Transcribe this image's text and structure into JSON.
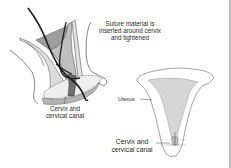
{
  "diagram": {
    "labels": {
      "suture": [
        "Suture material is",
        "inserted around cervix",
        "and tightened"
      ],
      "cervix_left": [
        "Cervix and",
        "cervical canal"
      ],
      "uterus": "Uterus",
      "cervix_right": [
        "Cervix and",
        "cervical canal"
      ]
    },
    "colors": {
      "outline": "#555555",
      "light_fill": "#d9d9d9",
      "mid_fill": "#a9a9a9",
      "dark_fill": "#7a7a7a",
      "suture": "#1e1e1e",
      "uterus_cavity": "#d6d6d6",
      "frame": "#bdbdbd"
    },
    "panels": [
      {
        "name": "side-view-cerclage",
        "description": "Sagittal view showing suture being placed around the cervix"
      },
      {
        "name": "frontal-uterus",
        "description": "Frontal view of uterus with cerclage at cervix"
      }
    ]
  }
}
